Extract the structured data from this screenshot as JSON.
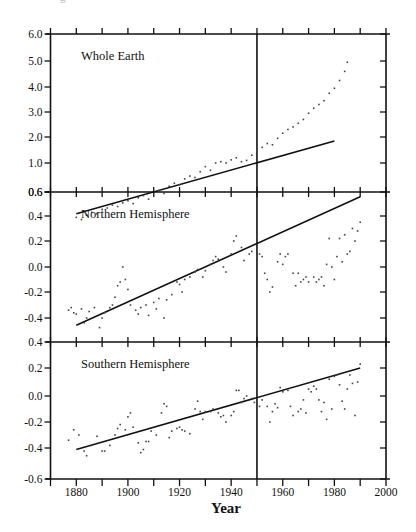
{
  "figure": {
    "caption_fragment": "g",
    "x_axis_title": "Year"
  },
  "chart_data": [
    {
      "type": "scatter",
      "title": "Whole Earth",
      "xlabel": "Year",
      "ylabel": "",
      "xlim": [
        1870,
        2000
      ],
      "ylim": [
        0.6,
        6.0
      ],
      "yticks": [
        {
          "value": 6.0,
          "label": "6.0",
          "px": 34
        },
        {
          "value": 5.0,
          "label": "5.0",
          "px": 61
        },
        {
          "value": 4.0,
          "label": "4.0",
          "px": 87
        },
        {
          "value": 3.0,
          "label": "3.0",
          "px": 112
        },
        {
          "value": 2.0,
          "label": "2.0",
          "px": 137
        },
        {
          "value": 1.0,
          "label": "1.0",
          "px": 163
        },
        {
          "value": 0.6,
          "label": "0.6",
          "px": 192
        }
      ],
      "reference_line_year": 1950,
      "fit_line": {
        "x": [
          1880,
          1980
        ],
        "y": [
          0.3,
          1.85
        ]
      },
      "series": [
        {
          "name": "observations",
          "x": [
            1880,
            1882,
            1884,
            1886,
            1888,
            1890,
            1892,
            1894,
            1896,
            1898,
            1900,
            1902,
            1904,
            1906,
            1908,
            1910,
            1912,
            1914,
            1916,
            1918,
            1920,
            1922,
            1924,
            1926,
            1928,
            1930,
            1932,
            1934,
            1936,
            1938,
            1940,
            1942,
            1944,
            1946,
            1948,
            1950,
            1952,
            1954,
            1956,
            1958,
            1960,
            1962,
            1964,
            1966,
            1968,
            1970,
            1972,
            1974,
            1976,
            1978,
            1980,
            1982,
            1984,
            1985
          ],
          "y": [
            0.25,
            0.22,
            0.28,
            0.32,
            0.3,
            0.36,
            0.38,
            0.42,
            0.4,
            0.45,
            0.48,
            0.44,
            0.52,
            0.55,
            0.5,
            0.6,
            0.62,
            0.58,
            0.68,
            0.72,
            0.7,
            0.78,
            0.82,
            0.8,
            0.88,
            0.95,
            0.9,
            1.0,
            1.05,
            1.0,
            1.12,
            1.2,
            1.05,
            1.1,
            1.3,
            1.45,
            1.6,
            1.75,
            1.7,
            1.95,
            2.15,
            2.3,
            2.4,
            2.55,
            2.7,
            2.95,
            3.15,
            3.3,
            3.45,
            3.75,
            3.95,
            4.25,
            4.6,
            4.95
          ]
        }
      ]
    },
    {
      "type": "scatter",
      "title": "Northern Hemisphere",
      "xlabel": "Year",
      "ylabel": "",
      "xlim": [
        1870,
        2000
      ],
      "ylim": [
        -0.6,
        0.6
      ],
      "yticks": [
        {
          "value": 0.6,
          "label": "0.6",
          "px": 192
        },
        {
          "value": 0.4,
          "label": "0.4",
          "px": 216
        },
        {
          "value": 0.2,
          "label": "0.2",
          "px": 241
        },
        {
          "value": 0.0,
          "label": "0.0",
          "px": 267
        },
        {
          "value": -0.2,
          "label": "-0.2",
          "px": 292
        },
        {
          "value": -0.4,
          "label": "-0.4",
          "px": 318
        }
      ],
      "reference_line_year": 1950,
      "fit_line": {
        "x": [
          1880,
          1990
        ],
        "y": [
          -0.46,
          0.56
        ]
      },
      "series": [
        {
          "name": "observations",
          "x": [
            1877,
            1878,
            1879,
            1880,
            1882,
            1883,
            1884,
            1885,
            1887,
            1889,
            1890,
            1891,
            1893,
            1894,
            1895,
            1896,
            1897,
            1898,
            1899,
            1900,
            1901,
            1903,
            1904,
            1905,
            1907,
            1908,
            1910,
            1911,
            1912,
            1914,
            1915,
            1917,
            1919,
            1920,
            1921,
            1922,
            1924,
            1926,
            1927,
            1929,
            1930,
            1932,
            1933,
            1934,
            1935,
            1937,
            1938,
            1940,
            1941,
            1942,
            1944,
            1945,
            1947,
            1948,
            1950,
            1951,
            1952,
            1953,
            1954,
            1955,
            1956,
            1958,
            1959,
            1960,
            1961,
            1962,
            1964,
            1965,
            1966,
            1967,
            1968,
            1969,
            1970,
            1972,
            1973,
            1974,
            1975,
            1976,
            1977,
            1978,
            1979,
            1980,
            1981,
            1982,
            1983,
            1984,
            1985,
            1986,
            1987,
            1988,
            1989,
            1990
          ],
          "y": [
            -0.34,
            -0.32,
            -0.36,
            -0.37,
            -0.33,
            -0.44,
            -0.4,
            -0.35,
            -0.32,
            -0.48,
            -0.4,
            -0.36,
            -0.32,
            -0.3,
            -0.24,
            -0.15,
            -0.12,
            -0.0,
            -0.1,
            -0.18,
            -0.3,
            -0.34,
            -0.37,
            -0.32,
            -0.3,
            -0.38,
            -0.28,
            -0.33,
            -0.25,
            -0.4,
            -0.26,
            -0.22,
            -0.12,
            -0.14,
            -0.2,
            -0.1,
            -0.08,
            -0.04,
            -0.02,
            -0.08,
            -0.03,
            0.02,
            0.05,
            0.08,
            0.06,
            0.0,
            -0.04,
            0.1,
            0.2,
            0.24,
            0.15,
            0.05,
            0.1,
            0.12,
            0.08,
            0.1,
            0.08,
            -0.05,
            -0.1,
            -0.2,
            -0.16,
            0.04,
            0.1,
            0.02,
            0.08,
            0.1,
            -0.05,
            -0.15,
            -0.05,
            -0.12,
            -0.1,
            -0.08,
            -0.12,
            -0.08,
            -0.12,
            -0.1,
            -0.08,
            -0.15,
            0.02,
            0.22,
            0.0,
            -0.1,
            0.08,
            0.22,
            0.04,
            0.25,
            0.1,
            0.12,
            0.3,
            0.2,
            0.28,
            0.35
          ]
        }
      ]
    },
    {
      "type": "scatter",
      "title": "Southern Hemisphere",
      "xlabel": "Year",
      "ylabel": "",
      "xlim": [
        1870,
        2000
      ],
      "ylim": [
        -0.6,
        0.4
      ],
      "yticks": [
        {
          "value": 0.4,
          "label": "0.4",
          "px": 342
        },
        {
          "value": 0.2,
          "label": "0.2",
          "px": 368
        },
        {
          "value": 0.0,
          "label": "0.0",
          "px": 396
        },
        {
          "value": -0.2,
          "label": "-0.2",
          "px": 422
        },
        {
          "value": -0.4,
          "label": "-0.4",
          "px": 448
        },
        {
          "value": -0.6,
          "label": "-0.6",
          "px": 479
        }
      ],
      "xticks": [
        {
          "value": 1880,
          "label": "1880"
        },
        {
          "value": 1900,
          "label": "1900"
        },
        {
          "value": 1920,
          "label": "1920"
        },
        {
          "value": 1940,
          "label": "1940"
        },
        {
          "value": 1960,
          "label": "1960"
        },
        {
          "value": 1980,
          "label": "1980"
        },
        {
          "value": 2000,
          "label": "2000"
        }
      ],
      "reference_line_year": 1950,
      "fit_line": {
        "x": [
          1880,
          1990
        ],
        "y": [
          -0.41,
          0.2
        ]
      },
      "series": [
        {
          "name": "observations",
          "x": [
            1877,
            1879,
            1881,
            1883,
            1884,
            1886,
            1888,
            1890,
            1891,
            1893,
            1895,
            1896,
            1897,
            1899,
            1900,
            1901,
            1902,
            1904,
            1905,
            1906,
            1907,
            1908,
            1909,
            1911,
            1913,
            1914,
            1915,
            1916,
            1917,
            1919,
            1920,
            1921,
            1922,
            1924,
            1926,
            1927,
            1928,
            1929,
            1930,
            1932,
            1933,
            1935,
            1936,
            1937,
            1938,
            1940,
            1941,
            1942,
            1943,
            1944,
            1945,
            1946,
            1948,
            1949,
            1951,
            1952,
            1954,
            1955,
            1956,
            1957,
            1958,
            1959,
            1960,
            1962,
            1963,
            1964,
            1966,
            1967,
            1968,
            1969,
            1970,
            1971,
            1972,
            1973,
            1974,
            1975,
            1976,
            1977,
            1978,
            1979,
            1980,
            1981,
            1982,
            1983,
            1984,
            1985,
            1986,
            1987,
            1988,
            1989,
            1990
          ],
          "y": [
            -0.34,
            -0.26,
            -0.3,
            -0.42,
            -0.45,
            -0.38,
            -0.31,
            -0.42,
            -0.42,
            -0.38,
            -0.3,
            -0.25,
            -0.22,
            -0.26,
            -0.16,
            -0.13,
            -0.24,
            -0.36,
            -0.43,
            -0.41,
            -0.35,
            -0.35,
            -0.27,
            -0.3,
            -0.13,
            -0.06,
            -0.08,
            -0.32,
            -0.27,
            -0.25,
            -0.24,
            -0.26,
            -0.27,
            -0.29,
            -0.1,
            -0.04,
            -0.12,
            -0.18,
            -0.12,
            -0.12,
            -0.1,
            -0.13,
            -0.16,
            -0.15,
            -0.2,
            -0.15,
            -0.12,
            0.04,
            0.04,
            -0.05,
            -0.02,
            0.0,
            -0.02,
            -0.05,
            -0.08,
            -0.03,
            -0.08,
            -0.2,
            -0.12,
            -0.06,
            -0.09,
            0.06,
            0.03,
            0.04,
            -0.08,
            -0.15,
            -0.12,
            -0.1,
            -0.03,
            -0.13,
            0.05,
            0.03,
            0.07,
            0.05,
            -0.03,
            -0.12,
            -0.05,
            -0.18,
            0.12,
            -0.1,
            0.14,
            0.15,
            0.08,
            -0.04,
            -0.1,
            0.05,
            0.15,
            0.09,
            -0.15,
            0.1,
            0.23
          ]
        }
      ]
    }
  ]
}
